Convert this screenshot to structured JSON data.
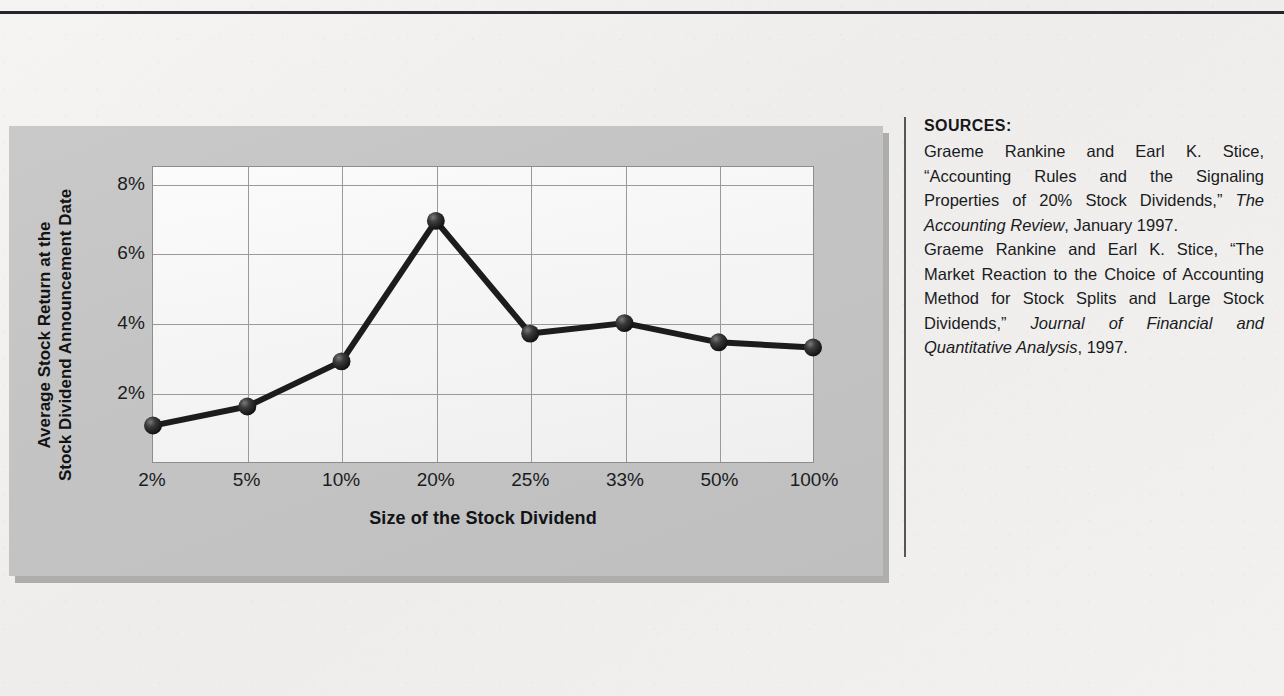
{
  "page": {
    "background_color": "#f1f0ee",
    "rule_color": "#25262a",
    "divider_color": "#55565a"
  },
  "chart_panel": {
    "panel_color": "#c4c4c4",
    "plot_background": "#f6f6f6",
    "gridline_color": "#9a9a9a",
    "series_color": "#1c1c1c"
  },
  "chart_data": {
    "type": "line",
    "title": "",
    "xlabel": "Size of the Stock Dividend",
    "ylabel": "Average Stock Return at the Stock Dividend Announcement Date",
    "ylabel_lines": [
      "Average Stock Return at the",
      "Stock Dividend Announcement Date"
    ],
    "categories": [
      "2%",
      "5%",
      "10%",
      "20%",
      "25%",
      "33%",
      "50%",
      "100%"
    ],
    "values": [
      1.05,
      1.6,
      2.9,
      6.95,
      3.7,
      4.0,
      3.45,
      3.3
    ],
    "ytick_labels": [
      "8%",
      "6%",
      "4%",
      "2%"
    ],
    "ytick_values": [
      8,
      6,
      4,
      2
    ],
    "ylim": [
      0,
      8.5
    ],
    "grid": true,
    "legend": "none",
    "marker": "sphere"
  },
  "sources": {
    "heading": "SOURCES:",
    "entries": [
      {
        "parts": [
          {
            "text": "Graeme Rankine and Earl K. Stice, “Accounting Rules and the Signaling Properties of 20% Stock Dividends,” ",
            "italic": false
          },
          {
            "text": "The Accounting Review",
            "italic": true
          },
          {
            "text": ", January 1997.",
            "italic": false
          }
        ]
      },
      {
        "parts": [
          {
            "text": "Graeme Rankine and Earl K. Stice, “The Market Reaction to the Choice of Accounting Method for Stock Splits and Large Stock Dividends,” ",
            "italic": false
          },
          {
            "text": "Journal of Financial and Quantitative Analysis",
            "italic": true
          },
          {
            "text": ", 1997.",
            "italic": false
          }
        ]
      }
    ]
  }
}
